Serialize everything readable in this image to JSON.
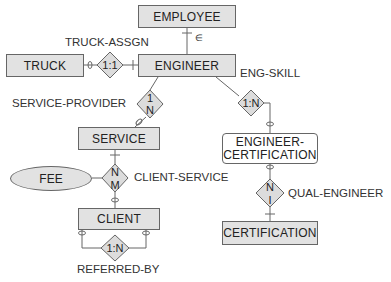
{
  "entities": {
    "employee": "EMPLOYEE",
    "engineer": "ENGINEER",
    "truck": "TRUCK",
    "service": "SERVICE",
    "client": "CLIENT",
    "engineer_certification_line1": "ENGINEER-",
    "engineer_certification_line2": "CERTIFICATION",
    "certification": "CERTIFICATION"
  },
  "attributes": {
    "fee": "FEE"
  },
  "relationships": {
    "truck_assgn": {
      "label": "TRUCK-ASSGN",
      "cardinality": "1:1"
    },
    "service_provider": {
      "label": "SERVICE-PROVIDER",
      "top": "1",
      "bottom": "N"
    },
    "eng_skill": {
      "label": "ENG-SKILL",
      "cardinality": "1:N"
    },
    "client_service": {
      "label": "CLIENT-SERVICE",
      "top": "N",
      "bottom": "M"
    },
    "referred_by": {
      "label": "REFERRED-BY",
      "cardinality": "1:N"
    },
    "qual_engineer": {
      "label": "QUAL-ENGINEER",
      "top": "N",
      "bottom": "I"
    }
  },
  "subtype_symbol": "∈",
  "colors": {
    "entity_fill": "#e2e2e2",
    "diamond_fill": "#dcdcdc",
    "stroke": "#666666",
    "text": "#222222"
  }
}
